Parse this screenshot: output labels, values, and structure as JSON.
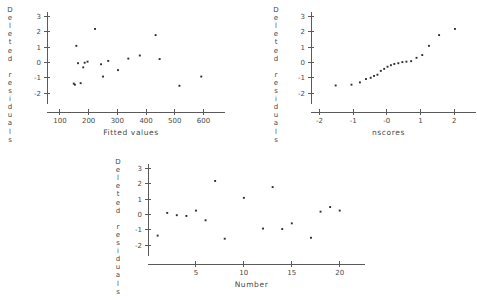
{
  "figure": {
    "kind": "regression-diagnostic-scatter-panels",
    "panel_count": 3,
    "point_color": "#2e2e2e",
    "axis_color": "#5a5a5a",
    "background": "#ffffff"
  },
  "shared": {
    "y_axis_label": "Deleted residuals",
    "y_axis_label_letters": [
      "D",
      "e",
      "l",
      "e",
      "t",
      "e",
      "d",
      "",
      "r",
      "e",
      "s",
      "i",
      "d",
      "u",
      "a",
      "l",
      "s"
    ],
    "y_ticks": [
      3,
      2,
      1,
      0,
      -1,
      -2
    ],
    "y_tick_labels": [
      "3",
      "2",
      "1",
      "0",
      "-1",
      "-2"
    ],
    "ylim": [
      -2.45,
      3.15
    ]
  },
  "chart_data": [
    {
      "id": "fitted",
      "type": "scatter",
      "title": "",
      "xlabel": "Fitted values",
      "ylabel": "Deleted residuals",
      "x_ticks": [
        100,
        200,
        300,
        400,
        500,
        600
      ],
      "x_tick_labels": [
        "100",
        "200",
        "300",
        "400",
        "500",
        "600"
      ],
      "xlim": [
        55,
        640
      ],
      "ylim": [
        -2.45,
        3.15
      ],
      "grid": false,
      "legend": false,
      "points": [
        {
          "x": 148,
          "y": -1.38
        },
        {
          "x": 152,
          "y": -1.45
        },
        {
          "x": 157,
          "y": 1.08
        },
        {
          "x": 163,
          "y": -0.05
        },
        {
          "x": 172,
          "y": -1.35
        },
        {
          "x": 181,
          "y": -0.32
        },
        {
          "x": 186,
          "y": -0.02
        },
        {
          "x": 196,
          "y": 0.05
        },
        {
          "x": 222,
          "y": 2.18
        },
        {
          "x": 243,
          "y": -0.12
        },
        {
          "x": 250,
          "y": -0.92
        },
        {
          "x": 268,
          "y": 0.1
        },
        {
          "x": 302,
          "y": -0.5
        },
        {
          "x": 338,
          "y": 0.25
        },
        {
          "x": 378,
          "y": 0.45
        },
        {
          "x": 433,
          "y": 1.78
        },
        {
          "x": 447,
          "y": 0.22
        },
        {
          "x": 516,
          "y": -1.52
        },
        {
          "x": 592,
          "y": -0.92
        }
      ]
    },
    {
      "id": "nscores",
      "type": "scatter",
      "title": "",
      "xlabel": "nscores",
      "ylabel": "Deleted residuals",
      "x_ticks": [
        -2,
        -1,
        0,
        1,
        2
      ],
      "x_tick_labels": [
        "-2",
        "-1",
        "-0",
        "1",
        "2"
      ],
      "xlim": [
        -2.25,
        2.35
      ],
      "ylim": [
        -2.45,
        3.15
      ],
      "grid": false,
      "legend": false,
      "points": [
        {
          "x": -1.52,
          "y": -1.5
        },
        {
          "x": -1.05,
          "y": -1.45
        },
        {
          "x": -0.8,
          "y": -1.3
        },
        {
          "x": -0.62,
          "y": -1.08
        },
        {
          "x": -0.48,
          "y": -1.0
        },
        {
          "x": -0.38,
          "y": -0.88
        },
        {
          "x": -0.28,
          "y": -0.8
        },
        {
          "x": -0.18,
          "y": -0.55
        },
        {
          "x": -0.08,
          "y": -0.42
        },
        {
          "x": 0.02,
          "y": -0.28
        },
        {
          "x": 0.12,
          "y": -0.18
        },
        {
          "x": 0.22,
          "y": -0.1
        },
        {
          "x": 0.34,
          "y": -0.05
        },
        {
          "x": 0.46,
          "y": 0.02
        },
        {
          "x": 0.58,
          "y": 0.05
        },
        {
          "x": 0.72,
          "y": 0.08
        },
        {
          "x": 0.88,
          "y": 0.3
        },
        {
          "x": 1.05,
          "y": 0.48
        },
        {
          "x": 1.25,
          "y": 1.08
        },
        {
          "x": 1.55,
          "y": 1.78
        },
        {
          "x": 2.02,
          "y": 2.18
        }
      ]
    },
    {
      "id": "number",
      "type": "scatter",
      "title": "",
      "xlabel": "Number",
      "ylabel": "Deleted residuals",
      "x_ticks": [
        5,
        10,
        15,
        20
      ],
      "x_tick_labels": [
        "5",
        "10",
        "15",
        "20"
      ],
      "xlim": [
        0.0,
        21.6
      ],
      "ylim": [
        -2.45,
        3.15
      ],
      "grid": false,
      "legend": false,
      "points": [
        {
          "x": 1,
          "y": -1.38
        },
        {
          "x": 2,
          "y": 0.1
        },
        {
          "x": 3,
          "y": -0.05
        },
        {
          "x": 4,
          "y": -0.1
        },
        {
          "x": 5,
          "y": 0.25
        },
        {
          "x": 6,
          "y": -0.38
        },
        {
          "x": 7,
          "y": 2.18
        },
        {
          "x": 8,
          "y": -1.58
        },
        {
          "x": 10,
          "y": 1.08
        },
        {
          "x": 12,
          "y": -0.92
        },
        {
          "x": 13,
          "y": 1.78
        },
        {
          "x": 14,
          "y": -0.95
        },
        {
          "x": 15,
          "y": -0.58
        },
        {
          "x": 17,
          "y": -1.52
        },
        {
          "x": 18,
          "y": 0.18
        },
        {
          "x": 19,
          "y": 0.48
        },
        {
          "x": 20,
          "y": 0.25
        }
      ]
    }
  ]
}
